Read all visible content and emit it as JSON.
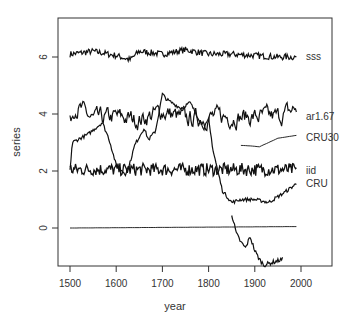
{
  "chart_data": {
    "type": "line",
    "title": "",
    "xlabel": "year",
    "ylabel": "series",
    "xlim": [
      1480,
      2075
    ],
    "ylim": [
      -1.35,
      7.35
    ],
    "xticks": [
      1500,
      1600,
      1700,
      1800,
      1900,
      2000
    ],
    "yticks": [
      0,
      2,
      4,
      6
    ],
    "grid": false,
    "legend": "direct labels at right of each series",
    "series": [
      {
        "name": "sss",
        "label_y": 6.0,
        "x_range": [
          1500,
          1990
        ],
        "mean": 6.1,
        "noise": 0.12,
        "approx_points": [
          [
            1500,
            6.1
          ],
          [
            1550,
            6.2
          ],
          [
            1600,
            6.05
          ],
          [
            1630,
            5.9
          ],
          [
            1650,
            6.2
          ],
          [
            1700,
            6.1
          ],
          [
            1750,
            6.25
          ],
          [
            1800,
            6.1
          ],
          [
            1850,
            6.1
          ],
          [
            1900,
            6.05
          ],
          [
            1950,
            6.0
          ],
          [
            1990,
            6.0
          ]
        ]
      },
      {
        "name": "ar1.67",
        "label_y": 3.9,
        "x_range": [
          1500,
          1990
        ],
        "mean": 3.9,
        "noise": 0.25,
        "approx_points": [
          [
            1500,
            3.7
          ],
          [
            1510,
            4.3
          ],
          [
            1550,
            3.8
          ],
          [
            1600,
            3.9
          ],
          [
            1650,
            3.8
          ],
          [
            1700,
            4.1
          ],
          [
            1750,
            3.8
          ],
          [
            1800,
            3.9
          ],
          [
            1850,
            3.9
          ],
          [
            1900,
            3.9
          ],
          [
            1950,
            3.9
          ],
          [
            1990,
            4.2
          ]
        ]
      },
      {
        "name": "CRU30",
        "label_y": 3.15,
        "x_range": [
          1870,
          1990
        ],
        "approx_points": [
          [
            1870,
            2.9
          ],
          [
            1890,
            2.88
          ],
          [
            1910,
            2.85
          ],
          [
            1930,
            3.0
          ],
          [
            1950,
            3.15
          ],
          [
            1970,
            3.2
          ],
          [
            1990,
            3.25
          ]
        ]
      },
      {
        "name": "iid",
        "label_y": 2.0,
        "x_range": [
          1500,
          1990
        ],
        "mean": 2.05,
        "noise": 0.18,
        "approx_points": [
          [
            1500,
            2.05
          ],
          [
            1600,
            2.05
          ],
          [
            1700,
            2.05
          ],
          [
            1800,
            2.05
          ],
          [
            1900,
            2.05
          ],
          [
            1990,
            2.05
          ]
        ]
      },
      {
        "name": "CRU",
        "label_y": 1.55,
        "x_range": [
          1500,
          1990
        ],
        "approx_points": [
          [
            1500,
            2.0
          ],
          [
            1505,
            3.0
          ],
          [
            1540,
            3.3
          ],
          [
            1570,
            3.7
          ],
          [
            1585,
            3.1
          ],
          [
            1600,
            2.2
          ],
          [
            1620,
            1.9
          ],
          [
            1630,
            2.3
          ],
          [
            1640,
            2.9
          ],
          [
            1660,
            3.5
          ],
          [
            1670,
            3.1
          ],
          [
            1685,
            3.4
          ],
          [
            1700,
            4.7
          ],
          [
            1710,
            4.5
          ],
          [
            1740,
            4.2
          ],
          [
            1760,
            4.4
          ],
          [
            1790,
            3.5
          ],
          [
            1800,
            3.8
          ],
          [
            1810,
            2.7
          ],
          [
            1820,
            2.0
          ],
          [
            1830,
            1.3
          ],
          [
            1850,
            0.9
          ],
          [
            1870,
            1.0
          ],
          [
            1900,
            1.0
          ],
          [
            1930,
            0.9
          ],
          [
            1960,
            1.2
          ],
          [
            1990,
            1.55
          ]
        ]
      },
      {
        "name": "(zero line)",
        "x_range": [
          1500,
          1990
        ],
        "approx_points": [
          [
            1500,
            0.0
          ],
          [
            1990,
            0.05
          ]
        ]
      },
      {
        "name": "(unlabeled descending)",
        "x_range": [
          1850,
          1960
        ],
        "approx_points": [
          [
            1850,
            0.5
          ],
          [
            1860,
            -0.2
          ],
          [
            1870,
            -0.5
          ],
          [
            1880,
            -0.7
          ],
          [
            1890,
            -0.3
          ],
          [
            1900,
            -0.8
          ],
          [
            1910,
            -1.1
          ],
          [
            1920,
            -1.3
          ],
          [
            1950,
            -1.15
          ],
          [
            1960,
            -1.1
          ]
        ]
      }
    ]
  }
}
